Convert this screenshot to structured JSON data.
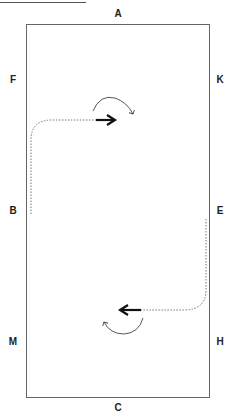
{
  "diagram": {
    "markers": {
      "top": "A",
      "bottom": "C",
      "left": [
        "F",
        "B",
        "M"
      ],
      "right": [
        "K",
        "E",
        "H"
      ]
    },
    "colors": {
      "arena_border": "#666666",
      "path": "#777777",
      "arrow": "#111111",
      "turn_arrow": "#444444"
    },
    "paths": [
      {
        "name": "path-from-b",
        "from": "B",
        "direction": "up then right",
        "style": "dotted"
      },
      {
        "name": "path-from-e",
        "from": "E",
        "direction": "down then left",
        "style": "dotted"
      }
    ],
    "turn_indicators": [
      {
        "name": "clockwise-turn-top",
        "rotation": "clockwise"
      },
      {
        "name": "clockwise-turn-bottom",
        "rotation": "clockwise"
      }
    ]
  }
}
